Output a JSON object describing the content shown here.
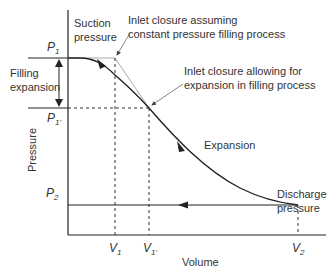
{
  "diagram": {
    "type": "pressure-volume diagram",
    "axes": {
      "xlabel": "Volume",
      "ylabel": "Pressure"
    },
    "y_ticks": [
      {
        "base": "P",
        "sub": "1"
      },
      {
        "base": "P",
        "sub": "1'"
      },
      {
        "base": "P",
        "sub": "2"
      }
    ],
    "x_ticks": [
      {
        "base": "V",
        "sub": "1"
      },
      {
        "base": "V",
        "sub": "1'"
      },
      {
        "base": "V",
        "sub": "2"
      }
    ],
    "annotations": {
      "suction_line1": "Suction",
      "suction_line2": "pressure",
      "filling_line1": "Filling",
      "filling_line2": "expansion",
      "inlet_const_line1": "Inlet closure assuming",
      "inlet_const_line2": "constant pressure filling process",
      "inlet_exp_line1": "Inlet closure allowing for",
      "inlet_exp_line2": "expansion in filling process",
      "expansion": "Expansion",
      "discharge_line1": "Discharge",
      "discharge_line2": "pressure"
    },
    "colors": {
      "line": "#222222",
      "guide": "#aaaaaa",
      "text": "#333333"
    }
  }
}
